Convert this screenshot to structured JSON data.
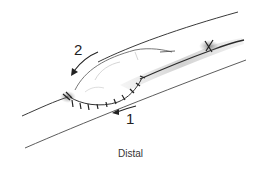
{
  "figure": {
    "caption": "Distal",
    "labels": {
      "step_1": "1",
      "step_2": "2"
    },
    "colors": {
      "line": "#2a2a2a",
      "shade": "#8a8a8a",
      "background": "#ffffff"
    }
  }
}
